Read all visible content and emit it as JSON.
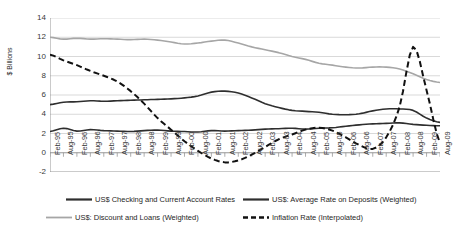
{
  "chart_data": {
    "type": "line",
    "title": "",
    "xlabel": "",
    "ylabel": "$ Billions",
    "ylim": [
      -2,
      14
    ],
    "ytick_values": [
      -2,
      0,
      2,
      4,
      6,
      8,
      10,
      12,
      14
    ],
    "ytick_labels": [
      "-2",
      "0",
      "2",
      "4",
      "6",
      "8",
      "10",
      "12",
      "14"
    ],
    "grid": "horizontal",
    "legend_position": "bottom",
    "categories": [
      "Feb-95",
      "Aug-95",
      "Feb-96",
      "Aug-96",
      "Feb-97",
      "Aug-97",
      "Feb-98",
      "Aug-98",
      "Feb-99",
      "Aug-99",
      "Feb-00",
      "Aug-00",
      "Feb-01",
      "Aug-01",
      "Feb-02",
      "Aug-02",
      "Feb-03",
      "Aug-03",
      "Feb-04",
      "Aug-04",
      "Feb-05",
      "Aug-05",
      "Feb-06",
      "Aug-06",
      "Feb-07",
      "Aug-07",
      "Feb-08",
      "Aug-08",
      "Feb-09",
      "Aug-09"
    ],
    "series": [
      {
        "name": "US$ Checking and Current Account Rates",
        "color": "#2e2e2e",
        "style": "solid",
        "width": 1.6,
        "values": [
          2.2,
          2.55,
          2.25,
          2.4,
          2.3,
          2.25,
          2.2,
          2.3,
          2.35,
          2.25,
          2.2,
          2.15,
          2.3,
          2.25,
          2.3,
          2.35,
          2.45,
          2.5,
          2.55,
          2.45,
          2.55,
          2.6,
          2.75,
          2.9,
          3.0,
          3.05,
          3.1,
          2.95,
          2.85,
          2.8
        ]
      },
      {
        "name": "US$: Average Rate on Deposits (Weighted)",
        "color": "#2e2e2e",
        "style": "solid",
        "width": 1.6,
        "values": [
          5.0,
          5.25,
          5.3,
          5.4,
          5.35,
          5.4,
          5.45,
          5.5,
          5.55,
          5.6,
          5.7,
          5.9,
          6.3,
          6.4,
          6.2,
          5.7,
          5.1,
          4.7,
          4.4,
          4.3,
          4.2,
          4.0,
          3.95,
          4.05,
          4.35,
          4.55,
          4.55,
          4.4,
          3.6,
          3.15
        ]
      },
      {
        "name": "US$: Discount and Loans (Weighted)",
        "color": "#a6a6a6",
        "style": "solid",
        "width": 1.6,
        "values": [
          12.0,
          11.8,
          11.9,
          11.8,
          11.85,
          11.8,
          11.75,
          11.8,
          11.7,
          11.5,
          11.3,
          11.4,
          11.6,
          11.7,
          11.4,
          11.0,
          10.7,
          10.4,
          10.0,
          9.7,
          9.3,
          9.1,
          8.9,
          8.8,
          8.9,
          8.9,
          8.7,
          8.2,
          7.6,
          7.3
        ]
      },
      {
        "name": "Inflation Rate (Interpolated)",
        "color": "#111111",
        "style": "dashed",
        "width": 2.0,
        "values": [
          10.2,
          9.6,
          9.1,
          8.5,
          8.0,
          7.4,
          6.4,
          5.1,
          3.6,
          2.4,
          1.2,
          0.2,
          -0.6,
          -1.0,
          -0.8,
          -0.2,
          0.6,
          1.4,
          1.9,
          2.4,
          2.6,
          2.3,
          1.6,
          0.8,
          0.4,
          1.6,
          4.8,
          11.0,
          6.5,
          1.0
        ]
      }
    ]
  },
  "legend": {
    "items": [
      {
        "label": "US$ Checking and Current Account Rates",
        "swatch": "solid-dark-line-icon"
      },
      {
        "label": "US$: Average Rate on Deposits (Weighted)",
        "swatch": "solid-dark-line-icon"
      },
      {
        "label": "US$: Discount and Loans (Weighted)",
        "swatch": "solid-gray-line-icon"
      },
      {
        "label": "Inflation Rate (Interpolated)",
        "swatch": "dashed-line-icon"
      }
    ]
  },
  "colors": {
    "gridline": "#c8c8c8",
    "axis": "#8a8a8a",
    "dark_series": "#2e2e2e",
    "gray_series": "#a6a6a6",
    "dashed_series": "#111111",
    "text": "#3a3a3a",
    "background": "#ffffff"
  }
}
